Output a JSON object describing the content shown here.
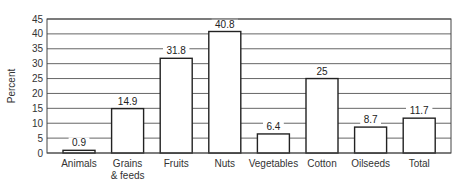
{
  "chart_data": {
    "type": "bar",
    "title": "",
    "xlabel": "",
    "ylabel": "Percent",
    "ylim": [
      0,
      45
    ],
    "yticks": [
      0,
      5,
      10,
      15,
      20,
      25,
      30,
      35,
      40,
      45
    ],
    "grid": true,
    "legend": null,
    "categories": [
      "Animals",
      "Grains & feeds",
      "Fruits",
      "Nuts",
      "Vegetables",
      "Cotton",
      "Oilseeds",
      "Total"
    ],
    "category_lines": [
      [
        "Animals"
      ],
      [
        "Grains",
        "& feeds"
      ],
      [
        "Fruits"
      ],
      [
        "Nuts"
      ],
      [
        "Vegetables"
      ],
      [
        "Cotton"
      ],
      [
        "Oilseeds"
      ],
      [
        "Total"
      ]
    ],
    "values": [
      0.9,
      14.9,
      31.8,
      40.8,
      6.4,
      25,
      8.7,
      11.7
    ],
    "value_labels": [
      "0.9",
      "14.9",
      "31.8",
      "40.8",
      "6.4",
      "25",
      "8.7",
      "11.7"
    ],
    "colors": {
      "bar_fill": "#ffffff",
      "bar_stroke": "#222222",
      "grid": "#555555"
    }
  }
}
